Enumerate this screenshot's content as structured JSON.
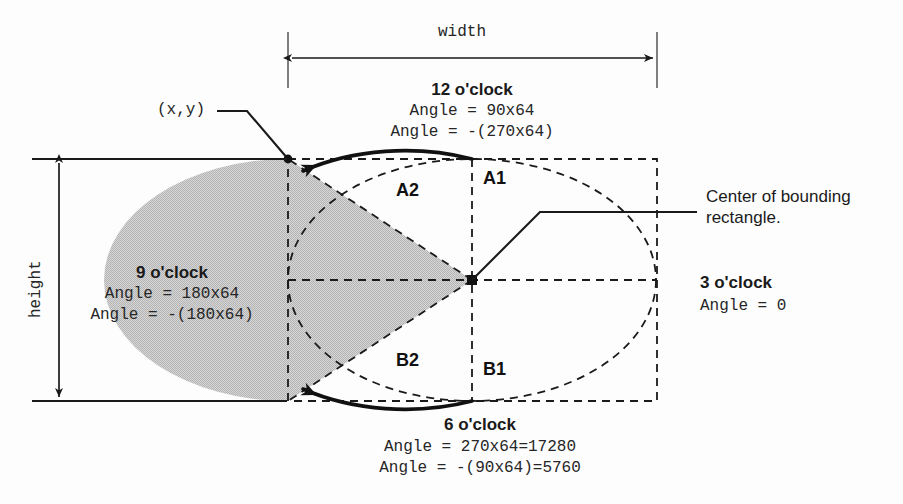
{
  "figure": {
    "dimensions": {
      "width_label": "width",
      "height_label": "height"
    },
    "origin_label": "(x,y)",
    "center_note": "Center of bounding\nrectangle.",
    "center_note_line1": "Center of bounding",
    "center_note_line2": "rectangle.",
    "clock_positions": [
      {
        "id": "twelve",
        "name": "12 o'clock",
        "angle_positive": "Angle = 90x64",
        "angle_negative": "Angle = -(270x64)"
      },
      {
        "id": "nine",
        "name": "9 o'clock",
        "angle_positive": "Angle = 180x64",
        "angle_negative": "Angle = -(180x64)"
      },
      {
        "id": "three",
        "name": "3 o'clock",
        "angle_positive": "Angle = 0",
        "angle_negative": ""
      },
      {
        "id": "six",
        "name": "6 o'clock",
        "angle_positive": "Angle = 270x64=17280",
        "angle_negative": "Angle = -(90x64)=5760"
      }
    ],
    "arc_labels": [
      {
        "id": "a1",
        "text": "A1"
      },
      {
        "id": "a2",
        "text": "A2"
      },
      {
        "id": "b1",
        "text": "B1"
      },
      {
        "id": "b2",
        "text": "B2"
      }
    ],
    "colors": {
      "fill": "#c9c9c9",
      "stroke": "#1a1a1a",
      "dashed": "#1a1a1a",
      "background": "#fdfdfd",
      "text": "#1a1a1a"
    },
    "geometry": {
      "bbox_left": 288,
      "bbox_top": 159,
      "bbox_right": 657,
      "bbox_bottom": 401,
      "center_x": 472,
      "center_y": 280
    }
  }
}
